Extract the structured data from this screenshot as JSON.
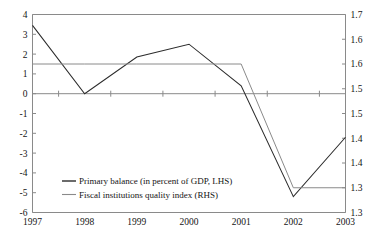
{
  "chart_data": {
    "type": "line",
    "title": "",
    "subtitle": "",
    "xlabel": "",
    "ylabel": "",
    "y2label": "",
    "grid": false,
    "legend_position": "inside-bottom-left",
    "x": [
      "1997",
      "1998",
      "1999",
      "2000",
      "2001",
      "2002",
      "2003"
    ],
    "xlim": [
      1997,
      2003
    ],
    "ylim": [
      -6,
      4
    ],
    "y2lim": [
      1.3,
      1.7
    ],
    "yticks": [
      4,
      3,
      2,
      1,
      0,
      -1,
      -2,
      -3,
      -4,
      -5,
      -6
    ],
    "ytick_labels": [
      "4",
      "3",
      "2",
      "1",
      "0",
      "-1",
      "-2",
      "-3",
      "-4",
      "-5",
      "-6"
    ],
    "y2ticks": [
      1.7,
      1.65,
      1.6,
      1.55,
      1.5,
      1.45,
      1.4,
      1.35,
      1.3
    ],
    "y2tick_labels": [
      "1.7",
      "1.6",
      "1.6",
      "1.5",
      "1.5",
      "1.4",
      "1.4",
      "1.3",
      "1.3"
    ],
    "xtick_labels": [
      "1997",
      "1998",
      "1999",
      "2000",
      "2001",
      "2002",
      "2003"
    ],
    "zero_line": 0,
    "series": [
      {
        "name": "Primary balance (in percent of GDP, LHS)",
        "axis": "left",
        "color": "#2b2b2b",
        "values": [
          3.45,
          0.0,
          1.85,
          2.5,
          0.4,
          -5.2,
          -2.2
        ]
      },
      {
        "name": "Fiscal institutions quality index (RHS)",
        "axis": "right",
        "color": "#8a8a8a",
        "values": [
          1.6,
          1.6,
          1.6,
          1.6,
          1.6,
          1.35,
          1.35
        ]
      }
    ]
  },
  "legend": {
    "items": [
      {
        "label": "Primary balance (in percent of GDP, LHS)",
        "color": "#2b2b2b"
      },
      {
        "label": "Fiscal institutions quality index (RHS)",
        "color": "#8a8a8a"
      }
    ]
  },
  "axes": {
    "left_tick_labels": [
      "4",
      "3",
      "2",
      "1",
      "0",
      "-1",
      "-2",
      "-3",
      "-4",
      "-5",
      "-6"
    ],
    "right_tick_labels": [
      "1.7",
      "1.6",
      "1.6",
      "1.5",
      "1.5",
      "1.4",
      "1.4",
      "1.3",
      "1.3"
    ],
    "x_tick_labels": [
      "1997",
      "1998",
      "1999",
      "2000",
      "2001",
      "2002",
      "2003"
    ]
  },
  "colors": {
    "frame": "#8a8a8a",
    "primary_balance": "#2b2b2b",
    "quality_index": "#8a8a8a",
    "background": "#ffffff"
  }
}
